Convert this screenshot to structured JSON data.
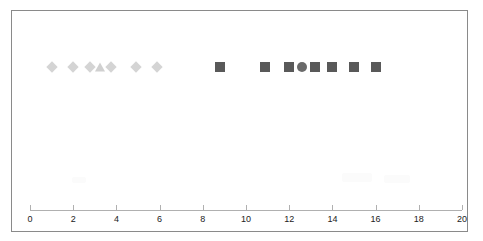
{
  "chart_data": {
    "type": "scatter",
    "title": "",
    "subtitle": "",
    "xlabel": "",
    "ylabel": "",
    "xlim": [
      0,
      20
    ],
    "xticks": [
      0,
      2,
      4,
      6,
      8,
      10,
      12,
      14,
      16,
      18,
      20
    ],
    "xtick_labels": [
      "0",
      "2",
      "4",
      "6",
      "8",
      "10",
      "12",
      "14",
      "16",
      "18",
      "20"
    ],
    "grid": false,
    "legend": null,
    "legend_position": "none",
    "y_single_row": true,
    "series": [
      {
        "name": "light-diamond-series",
        "marker": "diamond",
        "color": "#d4d4d4",
        "values": [
          1.0,
          2.0,
          2.8,
          3.75,
          4.9,
          5.9
        ],
        "y": 1
      },
      {
        "name": "light-triangle-series",
        "marker": "triangle",
        "color": "#d0d0d0",
        "values": [
          3.25
        ],
        "y": 1
      },
      {
        "name": "dark-square-series",
        "marker": "square",
        "color": "#595959",
        "values": [
          8.8,
          10.9,
          12.0,
          13.2,
          14.0,
          15.0,
          16.0
        ],
        "y": 1
      },
      {
        "name": "dark-circle-series",
        "marker": "circle",
        "color": "#6a6a6a",
        "values": [
          12.6
        ],
        "y": 1
      }
    ]
  },
  "axis": {
    "min_label": "0",
    "max_label": "20"
  }
}
